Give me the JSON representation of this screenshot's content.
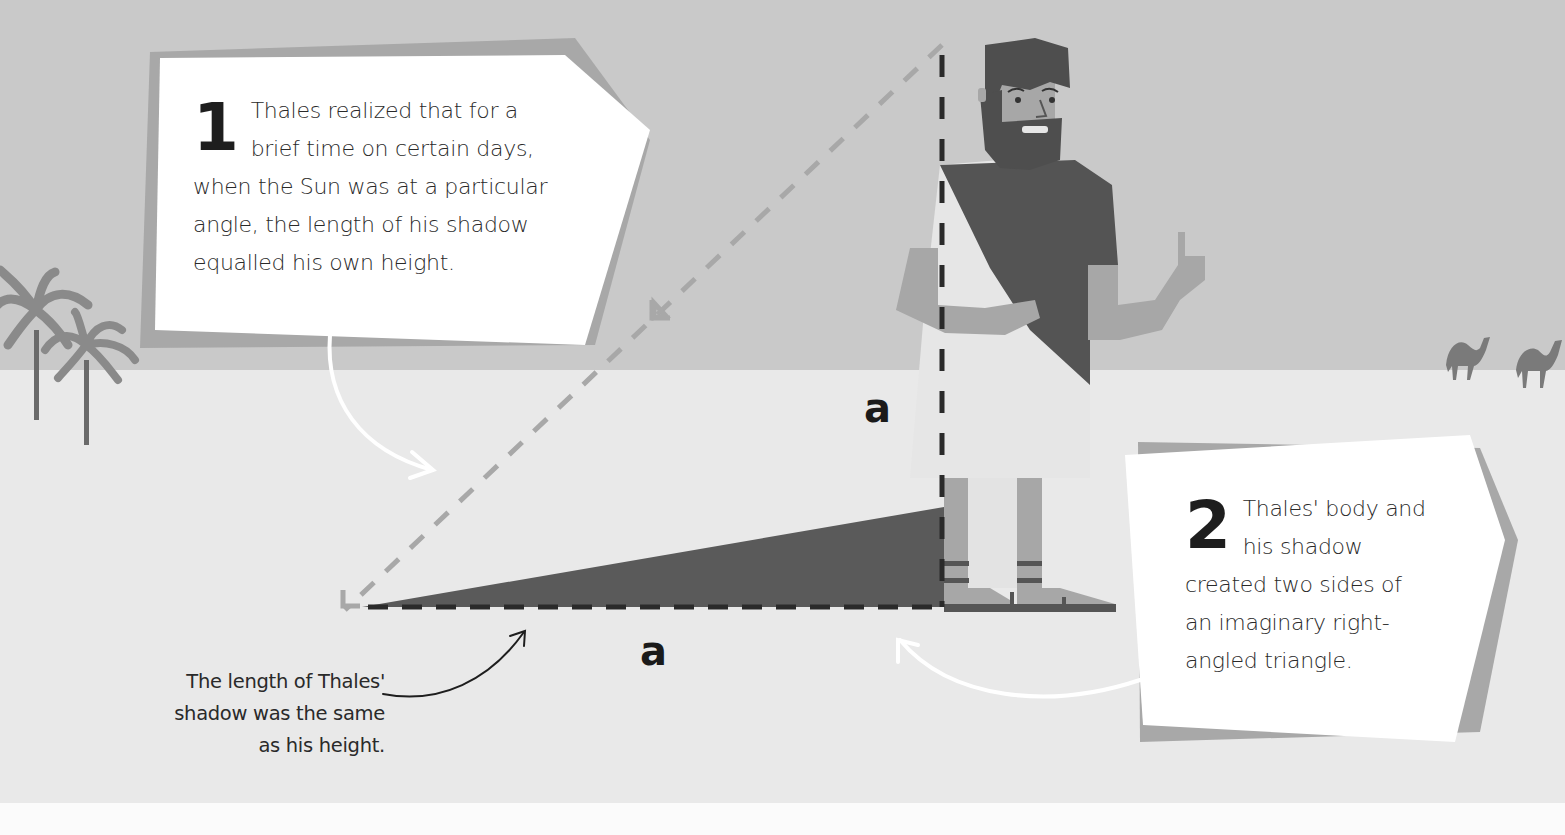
{
  "callouts": [
    {
      "number": "1",
      "lines": [
        "Thales realized that for a",
        "brief time on certain days,",
        "when the Sun was at a particular",
        "angle, the length of his shadow",
        "equalled his own height."
      ]
    },
    {
      "number": "2",
      "lines": [
        "Thales' body and",
        "his shadow",
        "created two sides of",
        "an imaginary right-",
        "angled triangle."
      ]
    }
  ],
  "note": {
    "lines": [
      "The length of Thales'",
      "shadow was the same",
      "as his height."
    ]
  },
  "labels": {
    "height_side": "a",
    "shadow_side": "a"
  },
  "icons": {
    "figure": "thales-figure",
    "trees": "palm-tree-icon",
    "camels": "camel-icon"
  },
  "colors": {
    "sky": "#c9c9c9",
    "ground": "#e9e9e9",
    "shadow": "#5a5a5a",
    "robe_dark": "#545454",
    "skin": "#a7a7a7",
    "card": "#ffffff"
  }
}
